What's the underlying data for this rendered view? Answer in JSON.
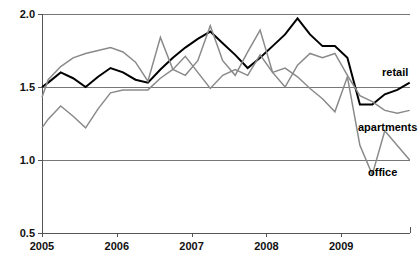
{
  "chart_data": {
    "type": "line",
    "title": "",
    "subtitle": "",
    "xlabel": "",
    "ylabel": "",
    "xlim": [
      2005.0,
      2009.92
    ],
    "ylim": [
      0.5,
      2.0
    ],
    "grid": true,
    "gridlines_y": [
      1.0,
      1.5,
      2.0
    ],
    "legend_position": "inline-right",
    "y_ticks": [
      "2.0",
      "1.5",
      "1.0",
      "0.5"
    ],
    "y_tick_values": [
      2.0,
      1.5,
      1.0,
      0.5
    ],
    "x_ticks": [
      "2005",
      "2006",
      "2007",
      "2008",
      "2009"
    ],
    "x_tick_values": [
      2005,
      2006,
      2007,
      2008,
      2009
    ],
    "x": [
      2005.0,
      2005.083,
      2005.25,
      2005.416,
      2005.583,
      2005.75,
      2005.916,
      2006.083,
      2006.25,
      2006.416,
      2006.583,
      2006.75,
      2006.916,
      2007.083,
      2007.25,
      2007.416,
      2007.583,
      2007.75,
      2007.916,
      2008.083,
      2008.25,
      2008.416,
      2008.583,
      2008.75,
      2008.916,
      2009.083,
      2009.25,
      2009.416,
      2009.583,
      2009.75,
      2009.916
    ],
    "series": [
      {
        "name": "retail",
        "color": "#000000",
        "width": 2.0,
        "values": [
          1.5,
          1.53,
          1.6,
          1.56,
          1.5,
          1.57,
          1.63,
          1.6,
          1.55,
          1.53,
          1.62,
          1.7,
          1.77,
          1.83,
          1.88,
          1.8,
          1.72,
          1.63,
          1.7,
          1.78,
          1.86,
          1.97,
          1.86,
          1.78,
          1.78,
          1.7,
          1.38,
          1.38,
          1.45,
          1.48,
          1.53
        ]
      },
      {
        "name": "apartments",
        "color": "#8a8a8a",
        "width": 1.5,
        "values": [
          1.43,
          1.55,
          1.64,
          1.7,
          1.73,
          1.75,
          1.77,
          1.74,
          1.67,
          1.54,
          1.84,
          1.62,
          1.58,
          1.68,
          1.92,
          1.68,
          1.58,
          1.74,
          1.89,
          1.6,
          1.5,
          1.65,
          1.73,
          1.7,
          1.73,
          1.58,
          1.44,
          1.4,
          1.34,
          1.32,
          1.34
        ]
      },
      {
        "name": "office",
        "color": "#8a8a8a",
        "width": 1.5,
        "values": [
          1.22,
          1.28,
          1.37,
          1.3,
          1.22,
          1.35,
          1.46,
          1.48,
          1.48,
          1.48,
          1.56,
          1.62,
          1.71,
          1.6,
          1.49,
          1.58,
          1.62,
          1.58,
          1.72,
          1.6,
          1.63,
          1.57,
          1.49,
          1.42,
          1.33,
          1.57,
          1.1,
          0.9,
          1.2,
          1.1,
          1.0
        ]
      }
    ],
    "annotations": [
      {
        "text": "retail",
        "series": "retail",
        "x_px": 382,
        "y_px": 76
      },
      {
        "text": "apartments",
        "series": "apartments",
        "x_px": 358,
        "y_px": 131
      },
      {
        "text": "office",
        "series": "office",
        "x_px": 368,
        "y_px": 176
      }
    ]
  }
}
